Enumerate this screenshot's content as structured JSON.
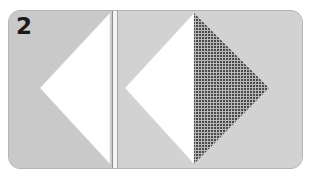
{
  "figure": {
    "step_number": "2",
    "panels": [
      {
        "name": "left-step",
        "shape": "white-triangle-folded"
      },
      {
        "name": "right-step",
        "shapes": [
          "white-triangle",
          "checkered-triangle"
        ]
      }
    ],
    "colors": {
      "background": "#cdcdcd",
      "paper_white": "#ffffff",
      "pattern_dark": "#4a4a4a",
      "pattern_light": "#c0c0c0",
      "divider": "#f4f4f4"
    }
  }
}
